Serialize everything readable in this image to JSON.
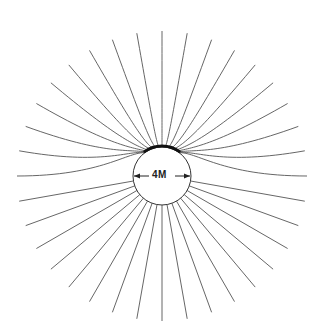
{
  "diagram": {
    "title": "",
    "label": "4M",
    "center": {
      "x": 162,
      "y": 176
    },
    "radius": 29,
    "line_count": 36,
    "line_length": 145,
    "colors": {
      "line": "#555555",
      "circle": "#333333",
      "dense_cap": "#111111",
      "background": "#ffffff"
    }
  }
}
